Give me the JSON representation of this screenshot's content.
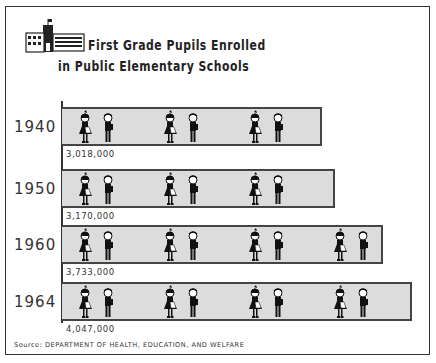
{
  "title": {
    "line1": "First Grade Pupils Enrolled",
    "line2": "in Public Elementary Schools",
    "icon": "school-building-icon"
  },
  "source": "Source: DEPARTMENT OF HEALTH, EDUCATION, AND WELFARE",
  "rows": [
    {
      "year": "1940",
      "label": "3,018,000",
      "top": 107,
      "width": 260,
      "pairs": 3
    },
    {
      "year": "1950",
      "label": "3,170,000",
      "top": 169,
      "width": 273,
      "pairs": 3
    },
    {
      "year": "1960",
      "label": "3,733,000",
      "top": 225,
      "width": 321,
      "pairs": 4
    },
    {
      "year": "1964",
      "label": "4,047,000",
      "top": 282,
      "width": 350,
      "pairs": 4
    }
  ],
  "chart_data": {
    "type": "bar",
    "orientation": "horizontal",
    "style": "pictograph",
    "categories": [
      "1940",
      "1950",
      "1960",
      "1964"
    ],
    "values": [
      3018000,
      3170000,
      3733000,
      4047000
    ],
    "value_labels": [
      "3,018,000",
      "3,170,000",
      "3,733,000",
      "4,047,000"
    ],
    "symbol": "pair of children (girl and boy)",
    "xlabel": "",
    "ylabel": "",
    "grid": false,
    "legend": null,
    "source": "Source: DEPARTMENT OF HEALTH, EDUCATION, AND WELFARE",
    "colors": {
      "bar_fill": "#dcdcdc",
      "bar_border": "#444444",
      "text": "#333333"
    }
  }
}
